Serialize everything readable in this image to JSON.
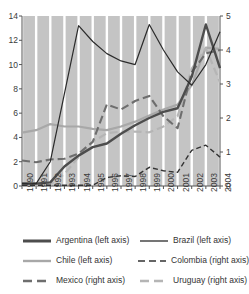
{
  "chart_data": {
    "type": "line",
    "title": "",
    "xlabel": "",
    "ylabel": "",
    "grid": true,
    "plot_background": "#c4c4c4",
    "gridline_color": "#ffffff",
    "legend_position": "bottom",
    "x": [
      1990,
      1991,
      1992,
      1993,
      1994,
      1995,
      1996,
      1997,
      1998,
      1999,
      2000,
      2001,
      2002,
      2003,
      2004
    ],
    "categories": [
      "1990",
      "1991",
      "1992",
      "1993",
      "1994",
      "1995",
      "1996",
      "1997",
      "1998",
      "1999",
      "2000",
      "2001",
      "2002",
      "2003",
      "2004"
    ],
    "left_axis": {
      "label": "",
      "ylim": [
        0,
        14
      ],
      "ticks": [
        0,
        2,
        4,
        6,
        8,
        10,
        12,
        14
      ],
      "tick_labels": [
        "0",
        "2",
        "4",
        "6",
        "8",
        "10",
        "12",
        "14"
      ]
    },
    "right_axis": {
      "label": "",
      "ylim": [
        0,
        5
      ],
      "ticks": [
        0,
        1,
        2,
        3,
        4,
        5
      ],
      "tick_labels": [
        "0",
        "1",
        "2",
        "3",
        "4",
        "5"
      ]
    },
    "series": [
      {
        "name": "Argentina (left axis)",
        "axis": "left",
        "color": "#4d4d4d",
        "width": 2.4,
        "dash": "none",
        "values": [
          0.2,
          0.2,
          0.3,
          1.6,
          2.5,
          3.2,
          3.5,
          4.3,
          5.0,
          5.6,
          6.1,
          6.4,
          9.0,
          13.3,
          9.7
        ]
      },
      {
        "name": "Brazil (left axis)",
        "axis": "left",
        "color": "#2b2b2b",
        "width": 1.2,
        "dash": "none",
        "values": [
          0.2,
          0.2,
          2.0,
          7.6,
          13.2,
          11.9,
          10.9,
          10.3,
          10.0,
          13.3,
          11.2,
          9.4,
          8.3,
          10.0,
          12.7
        ]
      },
      {
        "name": "Chile (left axis)",
        "axis": "left",
        "color": "#a8a8a8",
        "width": 2.2,
        "dash": "none",
        "values": [
          4.4,
          4.6,
          5.1,
          4.9,
          4.9,
          4.7,
          4.6,
          4.9,
          5.3,
          5.8,
          6.3,
          6.7,
          8.3,
          11.4,
          11.3
        ]
      },
      {
        "name": "Colombia (right axis)",
        "axis": "right",
        "color": "#333333",
        "width": 1.4,
        "dash": "5,3",
        "values": [
          0.02,
          0.02,
          0.02,
          0.02,
          0.02,
          0.02,
          0.25,
          0.3,
          0.28,
          0.55,
          0.45,
          0.4,
          1.05,
          1.2,
          0.85
        ]
      },
      {
        "name": "Mexico (right axis)",
        "axis": "right",
        "color": "#6e6e6e",
        "width": 2.1,
        "dash": "8,4",
        "values": [
          0.75,
          0.7,
          0.78,
          0.8,
          0.95,
          1.3,
          2.4,
          2.25,
          2.5,
          2.65,
          2.05,
          1.7,
          3.35,
          3.9,
          4.0
        ]
      },
      {
        "name": "Uruguay (right axis)",
        "axis": "right",
        "color": "#b5b5b5",
        "width": 2.2,
        "dash": "8,4",
        "values": [
          0.02,
          0.02,
          0.05,
          0.35,
          0.85,
          1.3,
          1.55,
          1.6,
          1.6,
          1.58,
          1.75,
          2.05,
          3.45,
          4.05,
          3.05
        ]
      }
    ]
  },
  "legend": {
    "items": [
      {
        "label": "Argentina (left axis)",
        "color": "#4d4d4d",
        "width": 3.0,
        "dash": "none"
      },
      {
        "label": "Brazil (left axis)",
        "color": "#2b2b2b",
        "width": 1.3,
        "dash": "none"
      },
      {
        "label": "Chile (left axis)",
        "color": "#a8a8a8",
        "width": 2.4,
        "dash": "none"
      },
      {
        "label": "Colombia (right axis)",
        "color": "#333333",
        "width": 1.6,
        "dash": "7,4"
      },
      {
        "label": "Mexico (right axis)",
        "color": "#6e6e6e",
        "width": 2.6,
        "dash": "9,5"
      },
      {
        "label": "Uruguay (right axis)",
        "color": "#b5b5b5",
        "width": 2.6,
        "dash": "9,5"
      }
    ]
  }
}
